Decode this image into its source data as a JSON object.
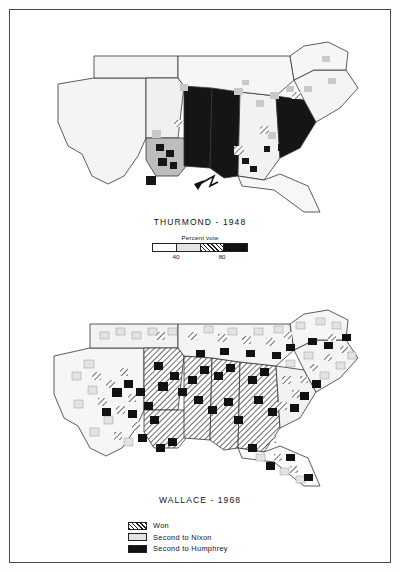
{
  "figure": {
    "maps": [
      {
        "id": "thurmond-1948",
        "caption": "THURMOND - 1948",
        "scale": {
          "title": "Percent vote",
          "ticks": [
            "40",
            "80"
          ],
          "swatches": [
            "white",
            "light-gray",
            "hatched",
            "black"
          ]
        }
      },
      {
        "id": "wallace-1968",
        "caption": "WALLACE - 1968",
        "legend": [
          {
            "key": "hatched",
            "label": "Won"
          },
          {
            "key": "light-gray",
            "label": "Second to Nixon"
          },
          {
            "key": "black",
            "label": "Second to Humphrey"
          }
        ]
      }
    ],
    "colors": {
      "ink": "#111111",
      "light_gray": "#e3e3e3",
      "mid_gray": "#bdbdbd",
      "black_fill": "#111111",
      "paper": "#ffffff",
      "frame": "#4a4a4a"
    }
  }
}
